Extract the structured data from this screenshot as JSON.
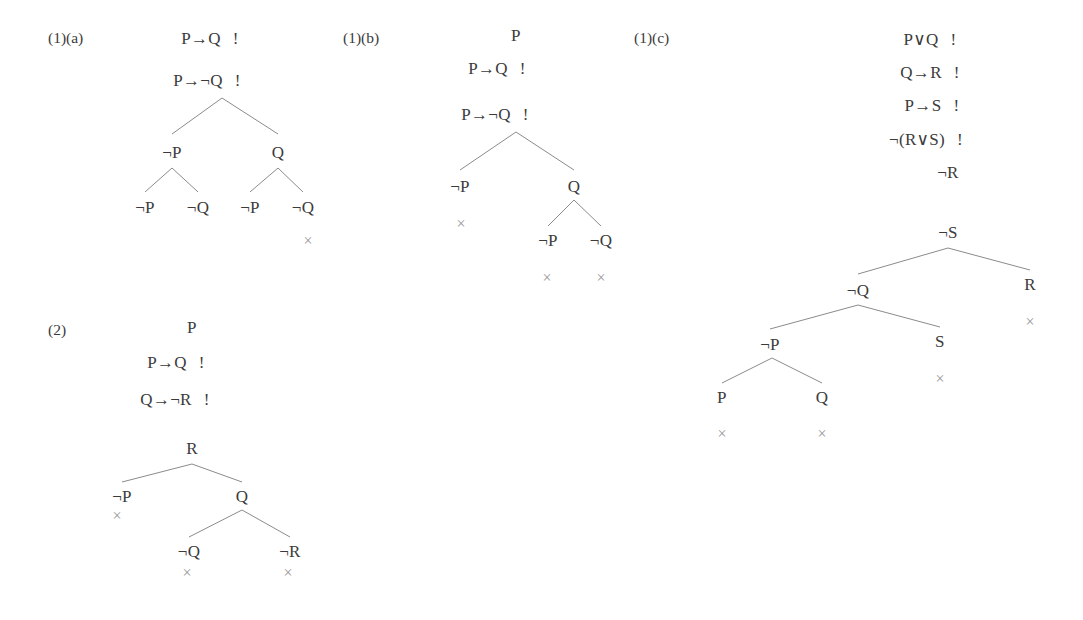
{
  "page": {
    "background_color": "#ffffff",
    "text_color": "#3b3b3b",
    "line_color": "#8b8b8b",
    "close_mark_color": "#9a9a9a",
    "width": 1083,
    "height": 620
  },
  "sections": [
    {
      "id": "1a",
      "label": "(1)(a)",
      "label_x": 48,
      "label_y": 38,
      "premises": [
        {
          "text": "P→Q",
          "flag": "!",
          "x": 210,
          "y": 38
        },
        {
          "text": "P→¬Q",
          "flag": "!",
          "x": 207,
          "y": 80
        }
      ],
      "nodes": [
        {
          "text": "¬P",
          "x": 172,
          "y": 152
        },
        {
          "text": "Q",
          "x": 278,
          "y": 152
        },
        {
          "text": "¬P",
          "x": 145,
          "y": 207
        },
        {
          "text": "¬Q",
          "x": 198,
          "y": 207
        },
        {
          "text": "¬P",
          "x": 250,
          "y": 207
        },
        {
          "text": "¬Q",
          "x": 303,
          "y": 207
        }
      ],
      "edges": [
        {
          "x1": 222,
          "y1": 98,
          "x2": 172,
          "y2": 134
        },
        {
          "x1": 222,
          "y1": 98,
          "x2": 278,
          "y2": 134
        },
        {
          "x1": 172,
          "y1": 168,
          "x2": 145,
          "y2": 192
        },
        {
          "x1": 172,
          "y1": 168,
          "x2": 198,
          "y2": 192
        },
        {
          "x1": 278,
          "y1": 168,
          "x2": 250,
          "y2": 192
        },
        {
          "x1": 278,
          "y1": 168,
          "x2": 303,
          "y2": 192
        }
      ],
      "close_marks": [
        {
          "symbol": "×",
          "x": 308,
          "y": 241
        }
      ]
    },
    {
      "id": "1b",
      "label": "(1)(b)",
      "label_x": 343,
      "label_y": 38,
      "premises": [
        {
          "text": "P",
          "flag": "",
          "x": 516,
          "y": 35
        },
        {
          "text": "P→Q",
          "flag": "!",
          "x": 497,
          "y": 68
        },
        {
          "text": "P→¬Q",
          "flag": "!",
          "x": 495,
          "y": 114
        }
      ],
      "nodes": [
        {
          "text": "¬P",
          "x": 460,
          "y": 186
        },
        {
          "text": "Q",
          "x": 574,
          "y": 186
        },
        {
          "text": "¬P",
          "x": 548,
          "y": 240
        },
        {
          "text": "¬Q",
          "x": 601,
          "y": 240
        }
      ],
      "edges": [
        {
          "x1": 516,
          "y1": 132,
          "x2": 460,
          "y2": 170
        },
        {
          "x1": 516,
          "y1": 132,
          "x2": 574,
          "y2": 170
        },
        {
          "x1": 574,
          "y1": 200,
          "x2": 548,
          "y2": 226
        },
        {
          "x1": 574,
          "y1": 200,
          "x2": 601,
          "y2": 226
        }
      ],
      "close_marks": [
        {
          "symbol": "×",
          "x": 461,
          "y": 224
        },
        {
          "symbol": "×",
          "x": 547,
          "y": 278
        },
        {
          "symbol": "×",
          "x": 601,
          "y": 278
        }
      ]
    },
    {
      "id": "1c",
      "label": "(1)(c)",
      "label_x": 634,
      "label_y": 38,
      "premises": [
        {
          "text": "P∨Q",
          "flag": "!",
          "x": 930,
          "y": 39
        },
        {
          "text": "Q→R",
          "flag": "!",
          "x": 930,
          "y": 72
        },
        {
          "text": "P→S",
          "flag": "!",
          "x": 932,
          "y": 105
        },
        {
          "text": "¬(R∨S)",
          "flag": "!",
          "x": 926,
          "y": 139
        },
        {
          "text": "¬R",
          "flag": "",
          "x": 948,
          "y": 172
        },
        {
          "text": "¬S",
          "flag": "",
          "x": 948,
          "y": 232
        }
      ],
      "nodes": [
        {
          "text": "¬Q",
          "x": 858,
          "y": 290
        },
        {
          "text": "R",
          "x": 1030,
          "y": 284
        },
        {
          "text": "¬P",
          "x": 770,
          "y": 344
        },
        {
          "text": "S",
          "x": 940,
          "y": 341
        },
        {
          "text": "P",
          "x": 722,
          "y": 397
        },
        {
          "text": "Q",
          "x": 822,
          "y": 397
        }
      ],
      "edges": [
        {
          "x1": 948,
          "y1": 248,
          "x2": 858,
          "y2": 274
        },
        {
          "x1": 948,
          "y1": 248,
          "x2": 1030,
          "y2": 270
        },
        {
          "x1": 858,
          "y1": 305,
          "x2": 770,
          "y2": 329
        },
        {
          "x1": 858,
          "y1": 305,
          "x2": 940,
          "y2": 327
        },
        {
          "x1": 772,
          "y1": 358,
          "x2": 722,
          "y2": 383
        },
        {
          "x1": 772,
          "y1": 358,
          "x2": 822,
          "y2": 383
        }
      ],
      "close_marks": [
        {
          "symbol": "×",
          "x": 1030,
          "y": 322
        },
        {
          "symbol": "×",
          "x": 940,
          "y": 379
        },
        {
          "symbol": "×",
          "x": 722,
          "y": 434
        },
        {
          "symbol": "×",
          "x": 822,
          "y": 434
        }
      ]
    },
    {
      "id": "2",
      "label": "(2)",
      "label_x": 48,
      "label_y": 330,
      "premises": [
        {
          "text": "P",
          "flag": "",
          "x": 192,
          "y": 327
        },
        {
          "text": "P→Q",
          "flag": "!",
          "x": 176,
          "y": 362
        },
        {
          "text": "Q→¬R",
          "flag": "!",
          "x": 175,
          "y": 399
        },
        {
          "text": "R",
          "flag": "",
          "x": 192,
          "y": 448
        }
      ],
      "nodes": [
        {
          "text": "¬P",
          "x": 122,
          "y": 496
        },
        {
          "text": "Q",
          "x": 242,
          "y": 496
        },
        {
          "text": "¬Q",
          "x": 189,
          "y": 551
        },
        {
          "text": "¬R",
          "x": 290,
          "y": 551
        }
      ],
      "edges": [
        {
          "x1": 192,
          "y1": 464,
          "x2": 122,
          "y2": 482
        },
        {
          "x1": 192,
          "y1": 464,
          "x2": 242,
          "y2": 482
        },
        {
          "x1": 242,
          "y1": 510,
          "x2": 189,
          "y2": 537
        },
        {
          "x1": 242,
          "y1": 510,
          "x2": 290,
          "y2": 537
        }
      ],
      "close_marks": [
        {
          "symbol": "×",
          "x": 117,
          "y": 516
        },
        {
          "symbol": "×",
          "x": 187,
          "y": 573
        },
        {
          "symbol": "×",
          "x": 288,
          "y": 573
        }
      ]
    }
  ]
}
